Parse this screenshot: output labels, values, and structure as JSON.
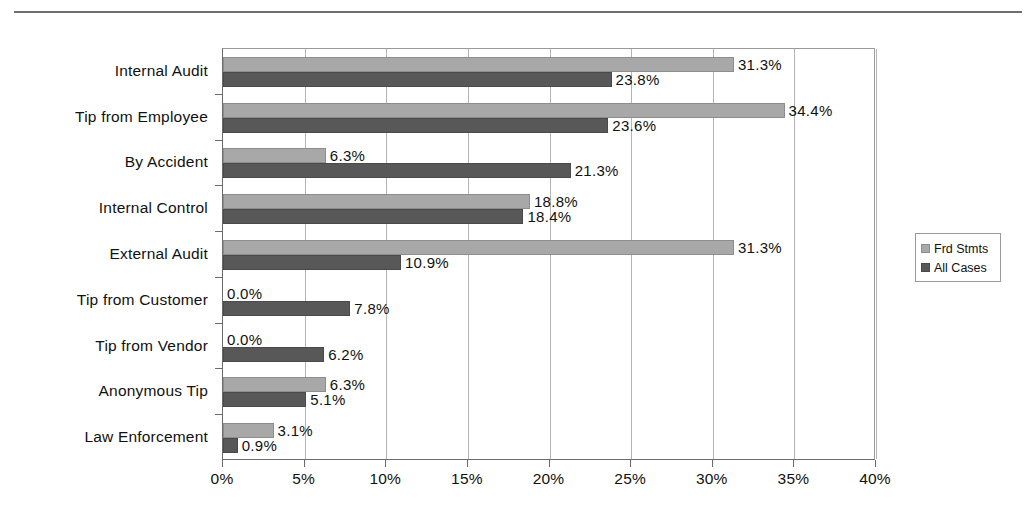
{
  "chart_data": {
    "type": "bar",
    "orientation": "horizontal",
    "title": "",
    "xlabel": "",
    "ylabel": "",
    "xlim": [
      0,
      40
    ],
    "xtick_labels": [
      "0%",
      "5%",
      "10%",
      "15%",
      "20%",
      "25%",
      "30%",
      "35%",
      "40%"
    ],
    "xticks": [
      0,
      5,
      10,
      15,
      20,
      25,
      30,
      35,
      40
    ],
    "grid": true,
    "legend_position": "right",
    "categories": [
      "Internal Audit",
      "Tip from Employee",
      "By Accident",
      "Internal Control",
      "External Audit",
      "Tip from Customer",
      "Tip from Vendor",
      "Anonymous Tip",
      "Law Enforcement"
    ],
    "series": [
      {
        "name": "Frd Stmts",
        "color": "#a8a8a8",
        "values": [
          31.3,
          34.4,
          6.3,
          18.8,
          31.3,
          0.0,
          0.0,
          6.3,
          3.1
        ],
        "labels": [
          "31.3%",
          "34.4%",
          "6.3%",
          "18.8%",
          "31.3%",
          "0.0%",
          "0.0%",
          "6.3%",
          "3.1%"
        ]
      },
      {
        "name": "All Cases",
        "color": "#585858",
        "values": [
          23.8,
          23.6,
          21.3,
          18.4,
          10.9,
          7.8,
          6.2,
          5.1,
          0.9
        ],
        "labels": [
          "23.8%",
          "23.6%",
          "21.3%",
          "18.4%",
          "10.9%",
          "7.8%",
          "6.2%",
          "5.1%",
          "0.9%"
        ]
      }
    ]
  },
  "legend": {
    "items": [
      {
        "label": "Frd Stmts",
        "color": "#a8a8a8"
      },
      {
        "label": "All Cases",
        "color": "#585858"
      }
    ]
  },
  "colors": {
    "series_light": "#a8a8a8",
    "series_dark": "#585858",
    "gridline": "#b4b4b4",
    "axis": "#6b6b6b",
    "text": "#111111"
  }
}
